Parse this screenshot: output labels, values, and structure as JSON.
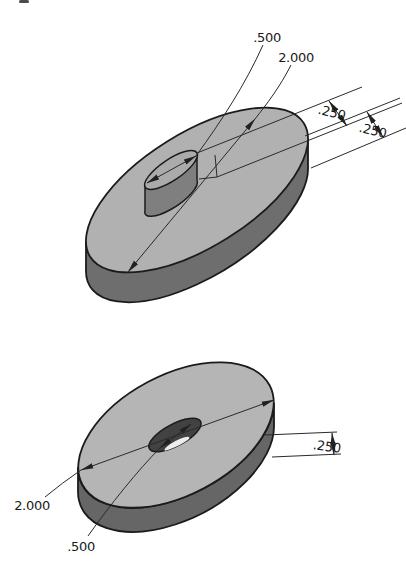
{
  "page": {
    "background": "#ffffff"
  },
  "artifact": {
    "smudge_color": "#4a4a4a"
  },
  "drawing": {
    "outline_color": "#1b1b1b",
    "dim_color": "#2a2a2a",
    "top_part": {
      "name": "disk-with-center-boss",
      "face_color": "#b1b1b1",
      "side_color": "#6e6e6e",
      "boss_face_color": "#ababab",
      "boss_side_color": "#7f7f7f",
      "dims": {
        "boss_diameter": ".500",
        "disk_diameter": "2.000",
        "boss_height": ".250",
        "disk_thickness": ".250"
      }
    },
    "bottom_part": {
      "name": "disk-with-center-hole",
      "face_color": "#b5b5b5",
      "side_color": "#666666",
      "hole_color": "#424242",
      "hole_highlight_color": "#ededed",
      "dims": {
        "disk_diameter": "2.000",
        "hole_diameter": ".500",
        "disk_thickness": ".250"
      }
    }
  }
}
